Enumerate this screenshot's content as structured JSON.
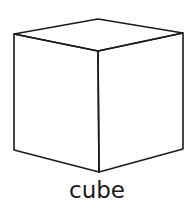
{
  "diagram": {
    "label": "cube",
    "stroke_color": "#1a1a1a",
    "vertices": {
      "top_back": [
        98,
        19
      ],
      "top_left": [
        14,
        34
      ],
      "top_right": [
        183,
        33
      ],
      "top_front": [
        98,
        51
      ],
      "bottom_left": [
        14,
        150
      ],
      "bottom_right": [
        183,
        149
      ],
      "bottom_front": [
        99,
        172
      ]
    }
  }
}
